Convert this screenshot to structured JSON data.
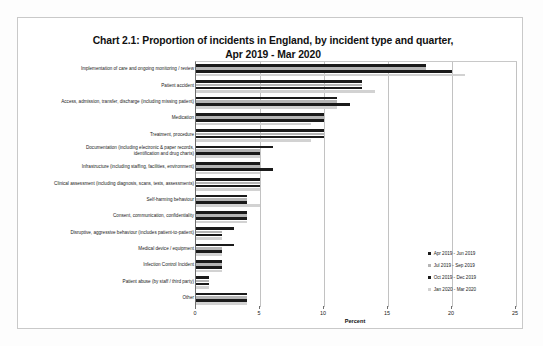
{
  "chart_data": {
    "type": "bar",
    "orientation": "horizontal",
    "title": "Chart 2.1: Proportion of incidents in England, by incident type and quarter, Apr 2019 - Mar 2020",
    "title_line1": "Chart 2.1: Proportion of incidents in England, by incident type and quarter,",
    "title_line2": "Apr 2019 - Mar 2020",
    "xlabel": "Percent",
    "ylabel": "",
    "xlim": [
      0,
      25
    ],
    "xticks": [
      0,
      5,
      10,
      15,
      20,
      25
    ],
    "grid": true,
    "legend_position": "bottom-right",
    "categories": [
      "Implementation of care and ongoing monitoring / review",
      "Patient accident",
      "Access, admission, transfer, discharge (including missing patient)",
      "Medication",
      "Treatment, procedure",
      "Documentation (including electronic & paper records,\nidentification and drug charts)",
      "Infrastructure (including staffing, facilities, environment)",
      "Clinical assessment (including diagnosis, scans, tests, assessments)",
      "Self-harming behaviour",
      "Consent, communication, confidentiality",
      "Disruptive, aggressive behaviour (includes patient-to-patient)",
      "Medical device / equipment",
      "Infection Control Incident",
      "Patient abuse (by staff / third party)",
      "Other"
    ],
    "series": [
      {
        "name": "Apr 2019 - Jun 2019",
        "color": "#1b1b1b",
        "values": [
          18,
          13,
          11,
          10,
          10,
          6,
          5,
          5,
          4,
          4,
          3,
          3,
          2,
          1,
          4
        ]
      },
      {
        "name": "Jul 2019 - Sep 2019",
        "color": "#b5b5b5",
        "values": [
          18,
          13,
          11,
          10,
          10,
          5,
          5,
          5,
          4,
          4,
          2,
          2,
          2,
          1,
          4
        ]
      },
      {
        "name": "Oct 2019 - Dec 2019",
        "color": "#1b1b1b",
        "values": [
          20,
          13,
          12,
          10,
          10,
          5,
          6,
          5,
          4,
          4,
          2,
          2,
          2,
          1,
          4
        ]
      },
      {
        "name": "Jan 2020 - Mar 2020",
        "color": "#d2d2d2",
        "values": [
          21,
          14,
          11,
          9,
          9,
          5,
          5,
          5,
          5,
          4,
          2,
          2,
          2,
          1,
          4
        ]
      }
    ]
  }
}
